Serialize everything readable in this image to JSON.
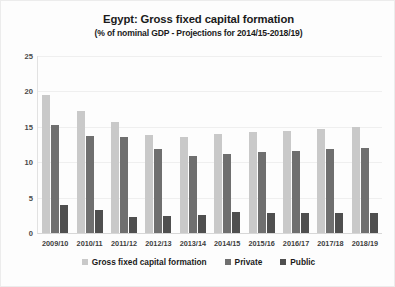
{
  "chart_data": {
    "type": "bar",
    "title": "Egypt: Gross fixed capital formation",
    "subtitle": "(% of nominal GDP - Projections for 2014/15-2018/19)",
    "xlabel": "",
    "ylabel": "",
    "ylim": [
      0,
      25
    ],
    "yticks": [
      0,
      5,
      10,
      15,
      20,
      25
    ],
    "grid": true,
    "legend_position": "bottom",
    "categories": [
      "2009/10",
      "2010/11",
      "2011/12",
      "2012/13",
      "2013/14",
      "2014/15",
      "2015/16",
      "2016/17",
      "2017/18",
      "2018/19"
    ],
    "series": [
      {
        "name": "Gross fixed capital formation",
        "color": "#c9c9c9",
        "values": [
          19.5,
          17.2,
          15.7,
          13.8,
          13.5,
          14.0,
          14.2,
          14.4,
          14.7,
          15.0
        ]
      },
      {
        "name": "Private",
        "color": "#6f6f6f",
        "values": [
          15.2,
          13.7,
          13.5,
          11.8,
          10.9,
          11.2,
          11.5,
          11.6,
          11.8,
          12.0
        ]
      },
      {
        "name": "Public",
        "color": "#4f4f4f",
        "values": [
          4.0,
          3.2,
          2.3,
          2.4,
          2.6,
          2.9,
          2.8,
          2.8,
          2.8,
          2.8
        ]
      }
    ]
  }
}
